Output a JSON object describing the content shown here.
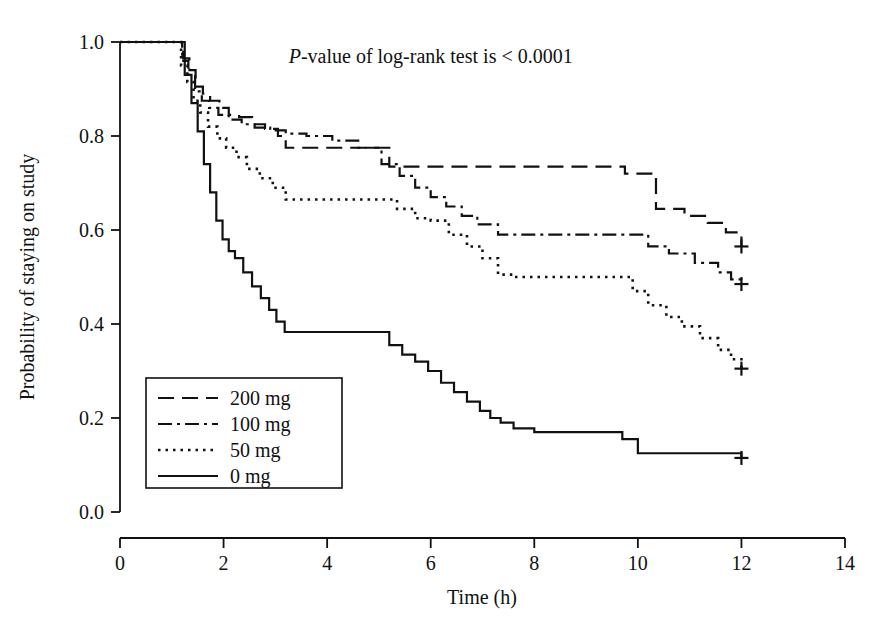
{
  "chart_data": {
    "type": "line",
    "title": "",
    "subtitle": "",
    "xlabel": "Time (h)",
    "ylabel": "Probability of staying on study",
    "xlim": [
      0,
      14
    ],
    "ylim": [
      0,
      1
    ],
    "xticks": [
      0,
      2,
      4,
      6,
      8,
      10,
      12,
      14
    ],
    "xtick_labels": [
      "0",
      "2",
      "4",
      "6",
      "8",
      "10",
      "12",
      "14"
    ],
    "yticks": [
      0.0,
      0.2,
      0.4,
      0.6,
      0.8,
      1.0
    ],
    "ytick_labels": [
      "0.0",
      "0.2",
      "0.4",
      "0.6",
      "0.8",
      "1.0"
    ],
    "grid": false,
    "legend_position": "lower-left-inside",
    "step_type": "post",
    "annotations": [
      {
        "name": "logrank-pvalue",
        "text_italic": "P",
        "text": "-value of log-rank test is < 0.0001",
        "x": 6.0,
        "y": 0.955
      }
    ],
    "censor_marker": "+",
    "series": [
      {
        "name": "200 mg",
        "label": "200 mg",
        "linestyle": "dashed",
        "color": "#111111",
        "censored_points": [
          [
            12.0,
            0.565
          ]
        ],
        "x": [
          0,
          1.1,
          1.22,
          1.34,
          1.46,
          1.6,
          1.74,
          1.92,
          2.1,
          2.3,
          2.55,
          2.8,
          3.05,
          3.2,
          5.0,
          5.2,
          9.5,
          9.75,
          10.1,
          10.35,
          10.9,
          11.35,
          11.7,
          12.0
        ],
        "y": [
          1.0,
          1.0,
          0.965,
          0.94,
          0.905,
          0.89,
          0.875,
          0.86,
          0.845,
          0.84,
          0.825,
          0.815,
          0.8,
          0.775,
          0.775,
          0.735,
          0.735,
          0.72,
          0.72,
          0.645,
          0.63,
          0.615,
          0.595,
          0.565
        ]
      },
      {
        "name": "100 mg",
        "label": "100 mg",
        "linestyle": "dashdot",
        "color": "#111111",
        "censored_points": [
          [
            12.0,
            0.485
          ]
        ],
        "x": [
          0,
          1.08,
          1.2,
          1.32,
          1.45,
          1.58,
          1.72,
          1.9,
          2.1,
          2.35,
          2.6,
          2.9,
          3.2,
          3.6,
          4.1,
          4.6,
          5.05,
          5.4,
          5.7,
          6.0,
          6.3,
          6.6,
          6.9,
          7.3,
          9.8,
          10.2,
          10.6,
          11.1,
          11.55,
          11.8,
          12.0
        ],
        "y": [
          1.0,
          1.0,
          0.96,
          0.93,
          0.895,
          0.875,
          0.86,
          0.845,
          0.835,
          0.825,
          0.818,
          0.812,
          0.805,
          0.8,
          0.79,
          0.775,
          0.74,
          0.715,
          0.69,
          0.67,
          0.65,
          0.63,
          0.612,
          0.59,
          0.59,
          0.565,
          0.55,
          0.53,
          0.51,
          0.495,
          0.485
        ]
      },
      {
        "name": "50 mg",
        "label": "50 mg",
        "linestyle": "dotted",
        "color": "#111111",
        "censored_points": [
          [
            12.0,
            0.305
          ]
        ],
        "x": [
          0,
          1.05,
          1.18,
          1.3,
          1.42,
          1.55,
          1.7,
          1.88,
          2.05,
          2.25,
          2.45,
          2.7,
          2.95,
          3.2,
          5.05,
          5.35,
          5.7,
          6.0,
          6.35,
          6.7,
          7.0,
          7.3,
          7.6,
          9.6,
          9.9,
          10.2,
          10.55,
          10.85,
          11.2,
          11.55,
          11.8,
          12.0
        ],
        "y": [
          1.0,
          1.0,
          0.95,
          0.915,
          0.875,
          0.85,
          0.82,
          0.795,
          0.775,
          0.755,
          0.73,
          0.71,
          0.69,
          0.665,
          0.665,
          0.645,
          0.625,
          0.62,
          0.59,
          0.565,
          0.54,
          0.505,
          0.5,
          0.5,
          0.47,
          0.44,
          0.415,
          0.395,
          0.37,
          0.345,
          0.325,
          0.305
        ]
      },
      {
        "name": "0 mg",
        "label": "0 mg",
        "linestyle": "solid",
        "color": "#111111",
        "censored_points": [
          [
            12.0,
            0.115
          ]
        ],
        "x": [
          0,
          1.12,
          1.25,
          1.38,
          1.5,
          1.62,
          1.74,
          1.86,
          1.98,
          2.1,
          2.22,
          2.38,
          2.55,
          2.72,
          2.88,
          3.02,
          3.18,
          5.0,
          5.2,
          5.45,
          5.7,
          5.95,
          6.2,
          6.45,
          6.7,
          6.95,
          7.15,
          7.35,
          7.6,
          8.0,
          9.4,
          9.7,
          10.0,
          11.9,
          12.0
        ],
        "y": [
          1.0,
          1.0,
          0.93,
          0.87,
          0.81,
          0.74,
          0.68,
          0.62,
          0.58,
          0.555,
          0.54,
          0.51,
          0.48,
          0.455,
          0.43,
          0.405,
          0.383,
          0.383,
          0.355,
          0.335,
          0.32,
          0.3,
          0.275,
          0.255,
          0.235,
          0.215,
          0.2,
          0.19,
          0.178,
          0.17,
          0.17,
          0.155,
          0.125,
          0.125,
          0.115
        ]
      }
    ]
  },
  "legend": {
    "items": [
      {
        "label": "200 mg",
        "linestyle": "dashed"
      },
      {
        "label": "100 mg",
        "linestyle": "dashdot"
      },
      {
        "label": "50 mg",
        "linestyle": "dotted"
      },
      {
        "label": "0 mg",
        "linestyle": "solid"
      }
    ]
  }
}
